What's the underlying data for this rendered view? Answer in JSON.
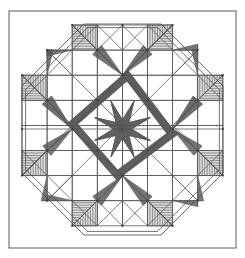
{
  "document": {
    "title": "Feathered Star Quilt Block Line Drawing",
    "kind": "geometric-line-art",
    "background_color": "#ffffff",
    "line_color": "#5a5a5a",
    "feather_line_color": "#555555",
    "node_color": "#3a3a3a",
    "canvas": {
      "width": 245,
      "height": 258
    }
  },
  "frame": {
    "outer_rect": {
      "x": 9,
      "y": 11,
      "width": 227,
      "height": 237
    },
    "stroke_width": 1.0
  },
  "octagon": {
    "note": "Square ring whose four corners are cut by double parallel diagonal bands",
    "inset": 13,
    "corner_cut": 62,
    "band_offset": 5,
    "stroke_width": 0.9
  },
  "grid": {
    "note": "Underlying lattice the star blocks sit on",
    "origin_x": 22,
    "origin_y": 25,
    "cell": 25.1,
    "cols": 8,
    "rows": 8,
    "stroke_width": 0.8
  },
  "center_star": {
    "type": "eight-point-feathered-star",
    "center_x": 122.5,
    "center_y": 129,
    "inner_radius": 9,
    "outer_radius": 30,
    "points": 8,
    "feather_rows": 6
  },
  "arm_blocks": {
    "note": "Four cross arms (N,E,S,W) each a square containing a V of diagonals plus feathered corners",
    "count": 4,
    "size": 50
  },
  "diagonal_blocks": {
    "note": "Four diagonal corner star blocks between the cross arms",
    "count": 4
  },
  "feathers": {
    "note": "Hatched triangular feather wedges radiating from every lattice node",
    "hatch_spacing": 2.3,
    "stroke_width": 0.65,
    "total_wedges": 96
  },
  "nodes": {
    "note": "Small dark dots at lattice intersections of the star",
    "radius": 1.1,
    "count": 33
  }
}
